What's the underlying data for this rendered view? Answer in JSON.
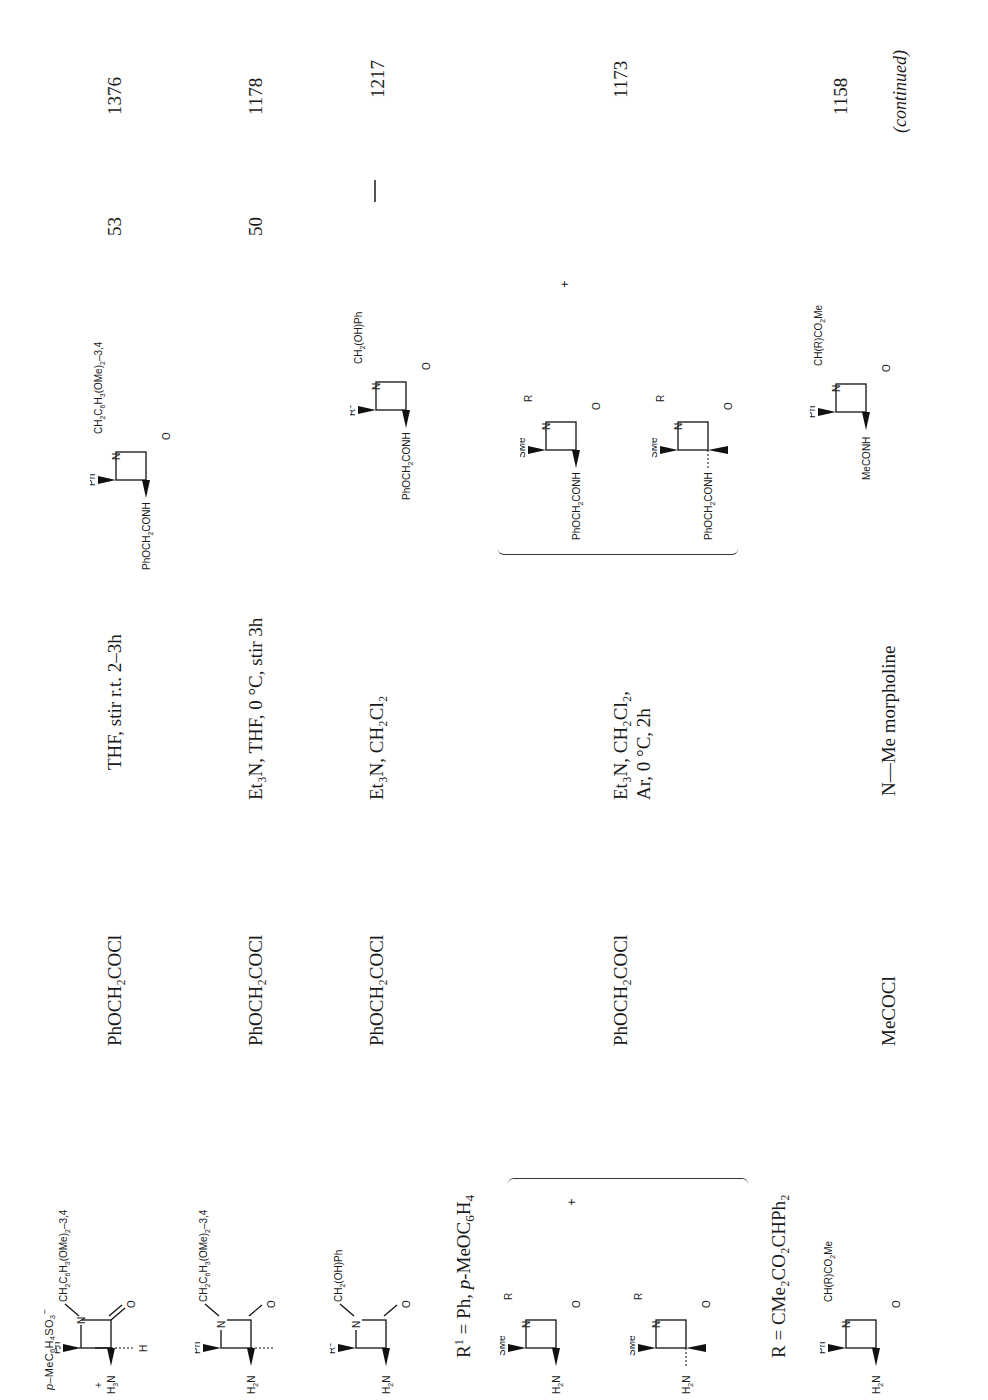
{
  "page": {
    "orientation": "rotated-90-ccw",
    "footer_note": "(continued)"
  },
  "columns": [
    "Amine",
    "Acid chloride",
    "Conditions",
    "Product",
    "Yield (%)",
    "Ref."
  ],
  "rows": [
    {
      "amine": {
        "counterion": "p-MeC6H4SO3−",
        "cation_label": "H3N+",
        "substituents": {
          "c3_wedge": "H3N+",
          "c3_h": "H",
          "c4_h": "H",
          "c4_wedge": "Ph",
          "n_sub": "CH2C6H3(OMe)2-3,4"
        }
      },
      "acid_chloride": "PhOCH2COCl",
      "conditions": "THF, stir r.t. 2–3h",
      "product": {
        "c3_wedge": "PhOCH2CONH",
        "c4_wedge": "Ph",
        "n_sub": "CH2C6H3(OMe)2-3,4"
      },
      "yield": "53",
      "ref": "1376"
    },
    {
      "amine": {
        "substituents": {
          "c3_wedge": "H2N",
          "c3_h": "H",
          "c4_h": "H",
          "c4_wedge": "Ph",
          "n_sub": "CH2C6H3(OMe)2-3,4"
        }
      },
      "acid_chloride": "PhOCH2COCl",
      "conditions": "Et3N, THF, 0°C, stir 3h",
      "product": null,
      "yield": "50",
      "ref": "1178"
    },
    {
      "amine": {
        "substituents": {
          "c3_wedge": "H2N",
          "c3_h": "H",
          "c4_h": "H",
          "c4_wedge": "R1",
          "n_sub": "CH2(OH)Ph"
        },
        "note": "R1 = Ph, p-MeOC6H4"
      },
      "acid_chloride": "PhOCH2COCl",
      "conditions": "Et3N, CH2Cl2",
      "product": {
        "c3_wedge": "PhOCH2CONH",
        "c4_wedge": "R1",
        "n_sub": "CH2(OH)Ph"
      },
      "yield": "—",
      "ref": "1217"
    },
    {
      "amine": {
        "mixture": true,
        "plus": "+",
        "isomers": [
          {
            "c3_wedge": "H2N",
            "c4_wedge": "SMe",
            "n_sub": "R",
            "c3_h": "H",
            "c4_h": "H",
            "stereo": "cis"
          },
          {
            "c3_dash": "H2N",
            "c3_h_wedge": "H",
            "c4_wedge": "SMe",
            "n_sub": "R",
            "c4_h": "H",
            "stereo": "trans"
          }
        ],
        "note": "R = CMe2CO2CHPh2"
      },
      "acid_chloride": "PhOCH2COCl",
      "conditions_line1": "Et3N, CH2Cl2,",
      "conditions_line2": "Ar, 0°C, 2h",
      "product": {
        "mixture": true,
        "plus": "+",
        "isomers": [
          {
            "c3_wedge": "PhOCH2CONH",
            "c4_wedge": "SMe",
            "n_sub": "R"
          },
          {
            "c3_dash": "PhOCH2CONH",
            "c3_h_wedge": "H",
            "c4_wedge": "SMe",
            "n_sub": "R"
          }
        ]
      },
      "yield": "",
      "ref": "1173"
    },
    {
      "amine": {
        "substituents": {
          "c3_wedge": "H2N",
          "c3_h": "H",
          "c4_h": "H",
          "c4_wedge": "Ph",
          "n_sub": "CH(R)CO2Me"
        }
      },
      "acid_chloride": "MeCOCl",
      "conditions": "N—Me morpholine",
      "product": {
        "c3_wedge": "MeCONH",
        "c4_wedge": "Ph",
        "n_sub": "CH(R)CO2Me"
      },
      "yield": "",
      "ref": "1158"
    }
  ],
  "labels": {
    "counterion": "p-MeC6H4SO3",
    "counterion_charge": "−",
    "r1_note_a": "R",
    "r1_note_b": "1",
    "r1_note_c": " = Ph, ",
    "r1_note_d": "p",
    "r1_note_e": "-MeOC",
    "r1_note_f": "6",
    "r1_note_g": "H",
    "r1_note_h": "4",
    "r_note": "R = CMe₂CO₂CHPh₂",
    "dash": "—",
    "plus": "+",
    "phoch2cocl": "PhOCH₂COCl",
    "mecocl": "MeCOCl",
    "cond1": "THF, stir r.t. 2–3h",
    "cond2": "Et₃N, THF, 0 °C, stir 3h",
    "cond3": "Et₃N, CH₂Cl₂",
    "cond4a": "Et₃N, CH₂Cl₂,",
    "cond4b": "Ar, 0 °C, 2h",
    "cond5": "N—Me morpholine",
    "y1": "53",
    "y2": "50",
    "y3": "—",
    "r1": "1376",
    "r2": "1178",
    "r3": "1217",
    "r4": "1173",
    "r5": "1158",
    "continued": "(continued)"
  }
}
